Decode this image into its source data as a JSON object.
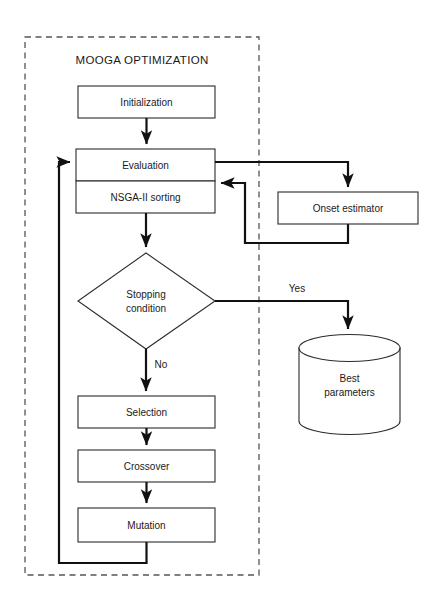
{
  "diagram": {
    "title": "MOOGA OPTIMIZATION",
    "type": "flowchart",
    "background_color": "#ffffff",
    "line_color": "#111111",
    "group": {
      "label": "MOOGA OPTIMIZATION",
      "border_style": "dashed",
      "border_color": "#555555"
    },
    "nodes": [
      {
        "id": "initialization",
        "label": "Initialization",
        "shape": "rect"
      },
      {
        "id": "evaluation",
        "label": "Evaluation",
        "shape": "rect"
      },
      {
        "id": "nsga",
        "label": "NSGA-II sorting",
        "shape": "rect"
      },
      {
        "id": "stopping",
        "label": "Stopping",
        "label2": "condition",
        "shape": "diamond"
      },
      {
        "id": "selection",
        "label": "Selection",
        "shape": "rect"
      },
      {
        "id": "crossover",
        "label": "Crossover",
        "shape": "rect"
      },
      {
        "id": "mutation",
        "label": "Mutation",
        "shape": "rect"
      },
      {
        "id": "onset",
        "label": "Onset estimator",
        "shape": "rect"
      },
      {
        "id": "best",
        "label": "Best",
        "label2": "parameters",
        "shape": "cylinder"
      }
    ],
    "edge_labels": {
      "yes": "Yes",
      "no": "No"
    },
    "edges": [
      {
        "from": "initialization",
        "to": "evaluation",
        "label": ""
      },
      {
        "from": "evaluation",
        "to": "onset",
        "label": ""
      },
      {
        "from": "onset",
        "to": "evaluation",
        "label": ""
      },
      {
        "from": "nsga",
        "to": "stopping",
        "label": ""
      },
      {
        "from": "stopping",
        "to": "best",
        "label": "Yes"
      },
      {
        "from": "stopping",
        "to": "selection",
        "label": "No"
      },
      {
        "from": "selection",
        "to": "crossover",
        "label": ""
      },
      {
        "from": "crossover",
        "to": "mutation",
        "label": ""
      },
      {
        "from": "mutation",
        "to": "evaluation",
        "label": ""
      }
    ]
  }
}
